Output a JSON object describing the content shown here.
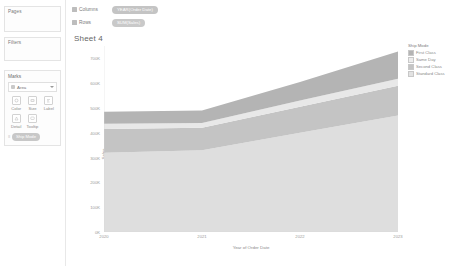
{
  "sidebar": {
    "pages": {
      "label": "Pages"
    },
    "filters": {
      "label": "Filters"
    },
    "marks": {
      "title": "Marks",
      "mark_type": "Area",
      "mark_type_icon": "area-mark-icon",
      "properties": [
        {
          "label": "Color",
          "icon": "color-icon"
        },
        {
          "label": "Size",
          "icon": "size-icon"
        },
        {
          "label": "Label",
          "icon": "label-icon"
        },
        {
          "label": "Detail",
          "icon": "detail-icon"
        },
        {
          "label": "Tooltip",
          "icon": "tooltip-icon"
        }
      ],
      "encoding_row": {
        "type_glyph": "color-legend-icon",
        "pill_label": "Ship Mode"
      }
    }
  },
  "shelves": {
    "columns": {
      "label": "Columns",
      "field": "YEAR(Order Date)",
      "icon": "columns-icon"
    },
    "rows": {
      "label": "Rows",
      "field": "SUM(Sales)",
      "icon": "rows-icon"
    }
  },
  "sheet": {
    "title": "Sheet 4"
  },
  "legend": {
    "title": "Ship Mode",
    "items": [
      {
        "label": "First Class",
        "color": "#b4b4b4"
      },
      {
        "label": "Same Day",
        "color": "#e4e4e4"
      },
      {
        "label": "Second Class",
        "color": "#c4c4c4"
      },
      {
        "label": "Standard Class",
        "color": "#dedede"
      }
    ]
  },
  "chart_data": {
    "type": "area",
    "title": "Sheet 4",
    "xlabel": "Year of Order Date",
    "ylabel": "Sales",
    "categories": [
      "2020",
      "2021",
      "2022",
      "2023"
    ],
    "x_tick_labels": [
      "2020",
      "2021",
      "2022",
      "2023"
    ],
    "y_tick_labels": [
      "700K",
      "600K",
      "500K",
      "400K",
      "300K",
      "200K",
      "100K",
      "0K"
    ],
    "y_tick_values": [
      700000,
      600000,
      500000,
      400000,
      300000,
      200000,
      100000,
      0
    ],
    "ylim": [
      0,
      750000
    ],
    "grid": false,
    "legend_position": "right",
    "stacked": true,
    "series": [
      {
        "name": "Standard Class",
        "color": "#dedede",
        "values": [
          320000,
          330000,
          400000,
          470000
        ]
      },
      {
        "name": "Second Class",
        "color": "#c4c4c4",
        "values": [
          95000,
          90000,
          105000,
          120000
        ]
      },
      {
        "name": "Same Day",
        "color": "#e8e8e8",
        "values": [
          22000,
          20000,
          25000,
          28000
        ]
      },
      {
        "name": "First Class",
        "color": "#b4b4b4",
        "values": [
          48000,
          50000,
          75000,
          110000
        ]
      }
    ],
    "totals": [
      485000,
      490000,
      605000,
      728000
    ]
  }
}
